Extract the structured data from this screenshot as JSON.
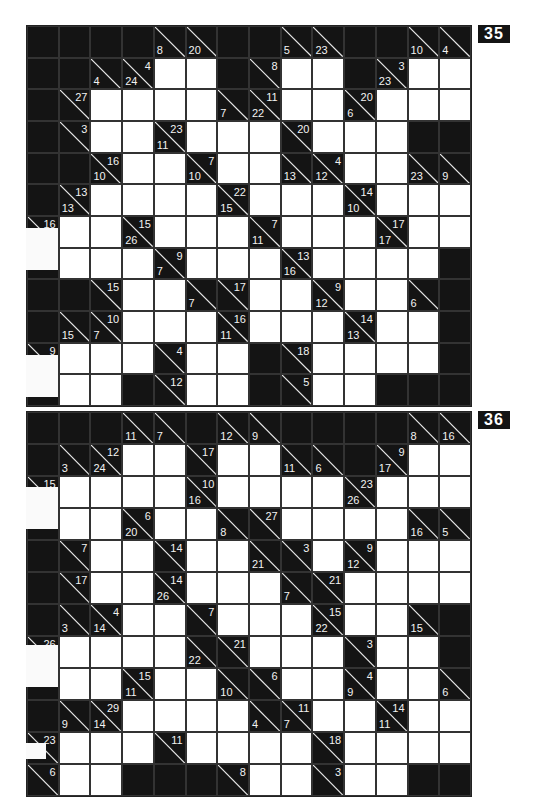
{
  "puzzles": [
    {
      "number": "35",
      "cols": 14,
      "rows": 12,
      "cells": [
        [
          "b",
          "b",
          "b",
          "b",
          {
            "d": "8"
          },
          {
            "d": "20"
          },
          "b",
          "b",
          {
            "d": "5"
          },
          {
            "d": "23"
          },
          "b",
          "b",
          {
            "d": "10"
          },
          {
            "d": "4"
          }
        ],
        [
          "b",
          "b",
          {
            "d": "4"
          },
          {
            "d": "24",
            "a": "4"
          },
          "w",
          "w",
          "b",
          {
            "a": "8"
          },
          "w",
          "w",
          "b",
          {
            "d": "23",
            "a": "3"
          },
          "w",
          "w"
        ],
        [
          "b",
          {
            "a": "27"
          },
          "w",
          "w",
          "w",
          "w",
          {
            "d": "7"
          },
          {
            "d": "22",
            "a": "11"
          },
          "w",
          "w",
          {
            "d": "6",
            "a": "20"
          },
          "w",
          "w",
          "w"
        ],
        [
          "b",
          {
            "a": "3"
          },
          "w",
          "w",
          {
            "d": "11",
            "a": "23"
          },
          "w",
          "w",
          "w",
          {
            "a": "20"
          },
          "w",
          "w",
          "w",
          "b",
          "b"
        ],
        [
          "b",
          "b",
          {
            "d": "10",
            "a": "16"
          },
          "w",
          "w",
          {
            "d": "10",
            "a": "7"
          },
          "w",
          "w",
          {
            "d": "13"
          },
          {
            "d": "12",
            "a": "4"
          },
          "w",
          "w",
          {
            "d": "23"
          },
          {
            "d": "9"
          }
        ],
        [
          "b",
          {
            "d": "13",
            "a": "13"
          },
          "w",
          "w",
          "w",
          "w",
          {
            "d": "15",
            "a": "22"
          },
          "w",
          "w",
          "w",
          {
            "d": "10",
            "a": "14"
          },
          "w",
          "w",
          "w"
        ],
        [
          {
            "a": "16"
          },
          "w",
          "w",
          {
            "d": "26",
            "a": "15"
          },
          "w",
          "w",
          "w",
          {
            "d": "11",
            "a": "7"
          },
          "w",
          "w",
          "w",
          {
            "d": "17",
            "a": "17"
          },
          "w",
          "w"
        ],
        [
          "b",
          "w",
          "w",
          "w",
          {
            "d": "7",
            "a": "9"
          },
          "w",
          "w",
          "w",
          {
            "d": "16",
            "a": "13"
          },
          "w",
          "w",
          "w",
          "w",
          "b"
        ],
        [
          "b",
          "b",
          {
            "a": "15"
          },
          "w",
          "w",
          {
            "d": "7"
          },
          {
            "a": "17"
          },
          "w",
          "w",
          {
            "d": "12",
            "a": "9"
          },
          "w",
          "w",
          {
            "d": "6"
          },
          "b"
        ],
        [
          "b",
          {
            "d": "15"
          },
          {
            "d": "7",
            "a": "10"
          },
          "w",
          "w",
          "w",
          {
            "d": "11",
            "a": "16"
          },
          "w",
          "w",
          "w",
          {
            "d": "13",
            "a": "14"
          },
          "w",
          "w",
          "b"
        ],
        [
          {
            "a": "9"
          },
          "w",
          "w",
          "w",
          {
            "a": "4"
          },
          "w",
          "w",
          "b",
          {
            "a": "18"
          },
          "w",
          "w",
          "w",
          "w",
          "b"
        ],
        [
          "b",
          "w",
          "w",
          "b",
          {
            "a": "12"
          },
          "w",
          "w",
          "b",
          {
            "a": "5"
          },
          "w",
          "w",
          "b",
          "b",
          "b"
        ]
      ]
    },
    {
      "number": "36",
      "cols": 14,
      "rows": 12,
      "cells": [
        [
          "b",
          "b",
          "b",
          {
            "d": "11"
          },
          {
            "d": "7"
          },
          "b",
          {
            "d": "12"
          },
          {
            "d": "9"
          },
          "b",
          "b",
          "b",
          "b",
          {
            "d": "8"
          },
          {
            "d": "16"
          }
        ],
        [
          "b",
          {
            "d": "3"
          },
          {
            "d": "24",
            "a": "12"
          },
          "w",
          "w",
          {
            "a": "17"
          },
          "w",
          "w",
          {
            "d": "11"
          },
          {
            "d": "6"
          },
          "b",
          {
            "d": "17",
            "a": "9"
          },
          "w",
          "w"
        ],
        [
          {
            "a": "15"
          },
          "w",
          "w",
          "w",
          "w",
          {
            "d": "16",
            "a": "10"
          },
          "w",
          "w",
          "w",
          "w",
          {
            "d": "26",
            "a": "23"
          },
          "w",
          "w",
          "w"
        ],
        [
          "b",
          "w",
          "w",
          {
            "d": "20",
            "a": "6"
          },
          "w",
          "w",
          {
            "d": "8"
          },
          {
            "a": "27"
          },
          "w",
          "w",
          "w",
          "w",
          {
            "d": "16"
          },
          {
            "d": "5"
          }
        ],
        [
          "b",
          {
            "a": "7"
          },
          "w",
          "w",
          {
            "a": "14"
          },
          "w",
          "w",
          {
            "d": "21"
          },
          {
            "a": "3"
          },
          "w",
          {
            "d": "12",
            "a": "9"
          },
          "w",
          "w",
          "w"
        ],
        [
          "b",
          {
            "a": "17"
          },
          "w",
          "w",
          {
            "d": "26",
            "a": "14"
          },
          "w",
          "w",
          "w",
          {
            "d": "7"
          },
          {
            "a": "21"
          },
          "w",
          "w",
          "w",
          "w"
        ],
        [
          "b",
          {
            "d": "3"
          },
          {
            "d": "14",
            "a": "4"
          },
          "w",
          "w",
          {
            "a": "7"
          },
          "w",
          "w",
          "w",
          {
            "d": "22",
            "a": "15"
          },
          "w",
          "w",
          {
            "d": "15"
          },
          "b"
        ],
        [
          {
            "a": "26"
          },
          "w",
          "w",
          "w",
          "w",
          {
            "d": "22"
          },
          {
            "a": "21"
          },
          "w",
          "w",
          "w",
          {
            "a": "3"
          },
          "w",
          "w",
          "b"
        ],
        [
          "b",
          "w",
          "w",
          {
            "d": "11",
            "a": "15"
          },
          "w",
          "w",
          {
            "d": "10"
          },
          {
            "a": "6"
          },
          "w",
          "w",
          {
            "d": "9",
            "a": "4"
          },
          "w",
          "w",
          {
            "d": "6"
          }
        ],
        [
          "b",
          {
            "d": "9"
          },
          {
            "d": "14",
            "a": "29"
          },
          "w",
          "w",
          "w",
          "w",
          {
            "d": "4"
          },
          {
            "d": "7",
            "a": "11"
          },
          "w",
          "w",
          {
            "d": "11",
            "a": "14"
          },
          "w",
          "w"
        ],
        [
          {
            "a": "23"
          },
          "w",
          "w",
          "w",
          {
            "a": "11"
          },
          "w",
          "w",
          "w",
          "w",
          {
            "a": "18"
          },
          "w",
          "w",
          "w",
          "w"
        ],
        [
          {
            "a": "6"
          },
          "w",
          "w",
          "b",
          "b",
          "b",
          {
            "a": "8"
          },
          "w",
          "w",
          {
            "a": "3"
          },
          "w",
          "w",
          "b",
          "b"
        ]
      ]
    }
  ],
  "colors": {
    "block": "#141414",
    "white_cell": "#ffffff",
    "clue_text": "#f2f2f2",
    "label_bg": "#141414",
    "label_text": "#ffffff"
  }
}
